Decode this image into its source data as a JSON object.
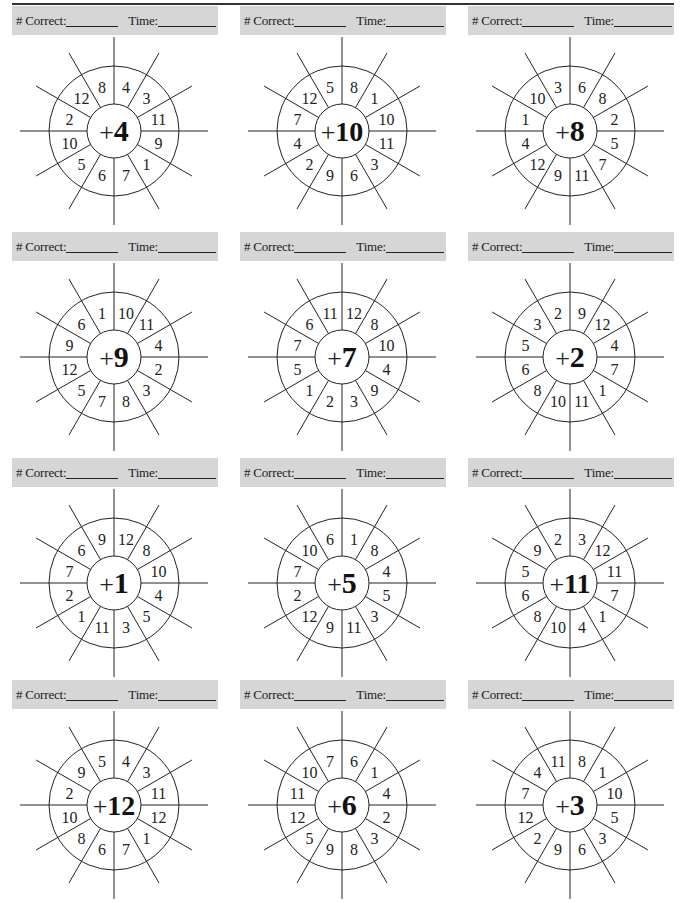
{
  "page": {
    "labels": {
      "correct": "# Correct:",
      "time": "Time:"
    },
    "colors": {
      "banner_bg": "#d6d6d6",
      "ink": "#1a1a1a"
    }
  },
  "wheels": [
    {
      "operator": "+",
      "addend": "4",
      "sector_values": [
        "4",
        "3",
        "11",
        "9",
        "1",
        "7",
        "6",
        "5",
        "10",
        "2",
        "12",
        "8"
      ]
    },
    {
      "operator": "+",
      "addend": "10",
      "sector_values": [
        "8",
        "1",
        "10",
        "11",
        "3",
        "6",
        "9",
        "2",
        "4",
        "7",
        "12",
        "5"
      ]
    },
    {
      "operator": "+",
      "addend": "8",
      "sector_values": [
        "6",
        "8",
        "2",
        "5",
        "7",
        "11",
        "9",
        "12",
        "4",
        "1",
        "10",
        "3"
      ]
    },
    {
      "operator": "+",
      "addend": "9",
      "sector_values": [
        "10",
        "11",
        "4",
        "2",
        "3",
        "8",
        "7",
        "5",
        "12",
        "9",
        "6",
        "1"
      ]
    },
    {
      "operator": "+",
      "addend": "7",
      "sector_values": [
        "12",
        "8",
        "10",
        "4",
        "9",
        "3",
        "2",
        "1",
        "5",
        "7",
        "6",
        "11"
      ]
    },
    {
      "operator": "+",
      "addend": "2",
      "sector_values": [
        "9",
        "12",
        "4",
        "7",
        "1",
        "11",
        "10",
        "8",
        "6",
        "5",
        "3",
        "2"
      ]
    },
    {
      "operator": "+",
      "addend": "1",
      "sector_values": [
        "12",
        "8",
        "10",
        "4",
        "5",
        "3",
        "11",
        "1",
        "2",
        "7",
        "6",
        "9"
      ]
    },
    {
      "operator": "+",
      "addend": "5",
      "sector_values": [
        "1",
        "8",
        "4",
        "5",
        "3",
        "11",
        "9",
        "12",
        "2",
        "7",
        "10",
        "6"
      ]
    },
    {
      "operator": "+",
      "addend": "11",
      "sector_values": [
        "3",
        "12",
        "11",
        "7",
        "1",
        "4",
        "10",
        "8",
        "6",
        "5",
        "9",
        "2"
      ]
    },
    {
      "operator": "+",
      "addend": "12",
      "sector_values": [
        "4",
        "3",
        "11",
        "12",
        "1",
        "7",
        "6",
        "8",
        "10",
        "2",
        "9",
        "5"
      ]
    },
    {
      "operator": "+",
      "addend": "6",
      "sector_values": [
        "6",
        "1",
        "4",
        "2",
        "3",
        "8",
        "9",
        "5",
        "12",
        "11",
        "10",
        "7"
      ]
    },
    {
      "operator": "+",
      "addend": "3",
      "sector_values": [
        "8",
        "1",
        "10",
        "5",
        "3",
        "6",
        "9",
        "2",
        "12",
        "7",
        "4",
        "11"
      ]
    }
  ]
}
